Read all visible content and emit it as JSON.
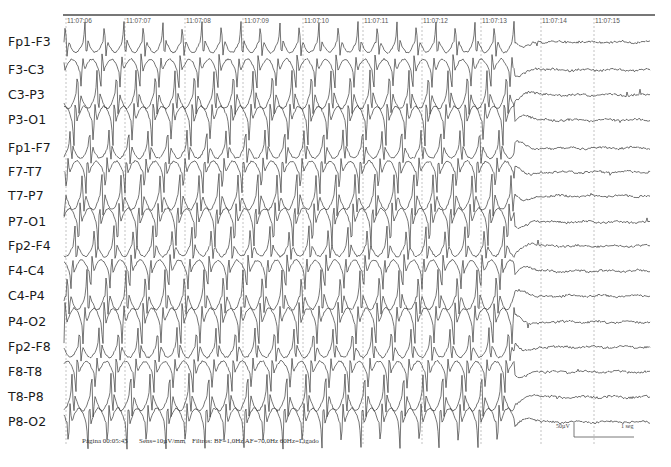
{
  "recording": {
    "type": "EEG",
    "montage": "longitudinal bipolar",
    "channels": [
      {
        "label": "Fp1-F3",
        "y": 42
      },
      {
        "label": "F3-C3",
        "y": 70
      },
      {
        "label": "C3-P3",
        "y": 95
      },
      {
        "label": "P3-O1",
        "y": 120
      },
      {
        "label": "Fp1-F7",
        "y": 148
      },
      {
        "label": "F7-T7",
        "y": 172
      },
      {
        "label": "T7-P7",
        "y": 196
      },
      {
        "label": "P7-O1",
        "y": 222
      },
      {
        "label": "Fp2-F4",
        "y": 246
      },
      {
        "label": "F4-C4",
        "y": 271
      },
      {
        "label": "C4-P4",
        "y": 296
      },
      {
        "label": "P4-O2",
        "y": 322
      },
      {
        "label": "Fp2-F8",
        "y": 347
      },
      {
        "label": "F8-T8",
        "y": 372
      },
      {
        "label": "T8-P8",
        "y": 397
      },
      {
        "label": "P8-O2",
        "y": 422
      }
    ],
    "time_markers": [
      {
        "label": "11:07:06",
        "x": 66
      },
      {
        "label": "11:07:07",
        "x": 125
      },
      {
        "label": "11:07:08",
        "x": 185
      },
      {
        "label": "11:07:09",
        "x": 243
      },
      {
        "label": "11:07:10",
        "x": 303
      },
      {
        "label": "11:07:11",
        "x": 363
      },
      {
        "label": "11:07:12",
        "x": 422
      },
      {
        "label": "11:07:13",
        "x": 481
      },
      {
        "label": "11:07:14",
        "x": 541
      },
      {
        "label": "11:07:15",
        "x": 594
      }
    ],
    "seizure_end_x": 515
  },
  "footer": {
    "page": "Página 00:05:45",
    "sensitivity": "Sens=10µV/mm",
    "filters": "Filtros: BF=1,0Hz AF=70,0Hz 60Hz=Ligado"
  },
  "scale_bar": {
    "amplitude": "50µV",
    "time": "1 seg"
  },
  "colors": {
    "trace": "#3a3a3a",
    "grid": "#9a9a9a",
    "label": "#1a1a1a",
    "background": "#ffffff"
  }
}
